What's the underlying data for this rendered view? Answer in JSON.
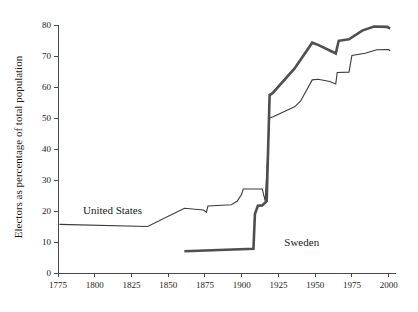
{
  "chart_data": {
    "type": "line",
    "title": "",
    "xlabel": "",
    "ylabel": "Electors as percentage of total population",
    "xlim": [
      1775,
      2005
    ],
    "ylim": [
      0,
      80
    ],
    "grid": false,
    "legend_position": "inline-annotation",
    "xticks": [
      1775,
      1800,
      1825,
      1850,
      1875,
      1900,
      1925,
      1950,
      1975,
      2000
    ],
    "xtick_labels": [
      "1775",
      "1800",
      "1825",
      "1850",
      "1875",
      "1900",
      "1925",
      "1950",
      "1975",
      "2000"
    ],
    "yticks": [
      0,
      10,
      20,
      30,
      40,
      50,
      60,
      70,
      80
    ],
    "ytick_labels": [
      "0",
      "10",
      "20",
      "30",
      "40",
      "50",
      "60",
      "70",
      "80"
    ],
    "series": [
      {
        "name": "United States",
        "label": "United States",
        "color": "#3a3a3a",
        "width": 1.1,
        "label_x": 1792,
        "label_y": 19.0,
        "points": [
          [
            1776,
            15.7
          ],
          [
            1836,
            15.0
          ],
          [
            1861,
            20.9
          ],
          [
            1874,
            20.3
          ],
          [
            1876,
            19.6
          ],
          [
            1877,
            21.6
          ],
          [
            1893,
            22.0
          ],
          [
            1897,
            23.2
          ],
          [
            1900,
            25.4
          ],
          [
            1901,
            27.1
          ],
          [
            1914,
            27.1
          ],
          [
            1916,
            23.2
          ],
          [
            1919,
            50.0
          ],
          [
            1921,
            50.3
          ],
          [
            1936,
            53.6
          ],
          [
            1940,
            55.4
          ],
          [
            1948,
            62.3
          ],
          [
            1952,
            62.5
          ],
          [
            1960,
            61.8
          ],
          [
            1964,
            61.0
          ],
          [
            1965,
            64.7
          ],
          [
            1973,
            64.8
          ],
          [
            1975,
            70.2
          ],
          [
            1984,
            70.9
          ],
          [
            1992,
            72.0
          ],
          [
            2000,
            72.1
          ],
          [
            2001,
            71.7
          ]
        ]
      },
      {
        "name": "Sweden",
        "label": "Sweden",
        "color": "#4f4f4f",
        "width": 2.6,
        "label_x": 1929,
        "label_y": 8.6,
        "points": [
          [
            1861,
            7.0
          ],
          [
            1908,
            7.8
          ],
          [
            1909,
            19.0
          ],
          [
            1911,
            21.7
          ],
          [
            1914,
            21.8
          ],
          [
            1917,
            23.2
          ],
          [
            1919,
            57.4
          ],
          [
            1921,
            58.0
          ],
          [
            1936,
            66.0
          ],
          [
            1948,
            74.3
          ],
          [
            1952,
            73.6
          ],
          [
            1962,
            71.3
          ],
          [
            1964,
            70.8
          ],
          [
            1966,
            74.9
          ],
          [
            1973,
            75.4
          ],
          [
            1982,
            78.2
          ],
          [
            1990,
            79.5
          ],
          [
            1999,
            79.4
          ],
          [
            2001,
            78.8
          ]
        ]
      }
    ]
  }
}
